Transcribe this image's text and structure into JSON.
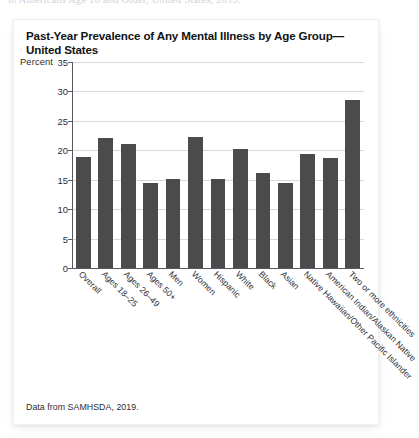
{
  "page": {
    "clipped_header_text": "in Americans Age 18 and Older, United States, 2019."
  },
  "card": {
    "title": "Past-Year Prevalence of Any Mental Illness by Age Group—United States",
    "source_note": "Data from SAMHSDA, 2019."
  },
  "chart_data": {
    "type": "bar",
    "title": "Past-Year Prevalence of Any Mental Illness by Age Group—United States",
    "xlabel": "",
    "ylabel": "Percent",
    "ylim": [
      0,
      35
    ],
    "yticks": [
      0,
      5,
      10,
      15,
      20,
      25,
      30,
      35
    ],
    "grid": true,
    "legend": false,
    "bar_color": "#4b4b4d",
    "categories": [
      "Overall",
      "Ages 18–25",
      "Ages 26–49",
      "Ages 50+",
      "Men",
      "Women",
      "Hispanic",
      "White",
      "Black",
      "Asian",
      "Native Hawaiian/Other Pacific Islander",
      "American Indian/Alaskan Native",
      "Two or more ethnicities"
    ],
    "values": [
      18.9,
      22.1,
      21.0,
      14.5,
      15.1,
      22.2,
      15.2,
      20.3,
      16.1,
      14.4,
      19.3,
      18.7,
      28.6
    ]
  }
}
